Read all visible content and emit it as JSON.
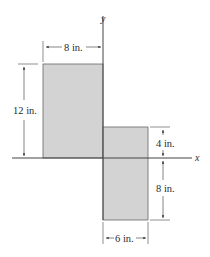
{
  "diagram": {
    "axes": {
      "x_label": "x",
      "y_label": "y"
    },
    "shapes": [
      {
        "name": "upper-left-rectangle",
        "width": "8 in.",
        "height": "12 in."
      },
      {
        "name": "lower-right-rectangle",
        "width": "6 in.",
        "height_above_x": "4 in.",
        "height_below_x": "8 in."
      }
    ],
    "dimensions": {
      "top_width": "8 in.",
      "left_height": "12 in.",
      "right_upper_height": "4 in.",
      "right_lower_height": "8 in.",
      "bottom_width": "6 in."
    },
    "colors": {
      "fill": "#d3d3d3",
      "stroke": "#555555",
      "axis": "#444444"
    }
  }
}
